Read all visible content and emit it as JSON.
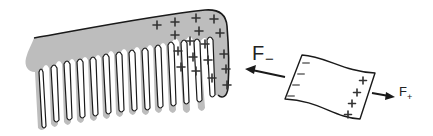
{
  "figure": {
    "colors": {
      "comb_fill": "#bdbdbd",
      "ink": "#1a1a1a",
      "negative_mark": "#8c8c8c",
      "background": "#ffffff"
    },
    "comb": {
      "charge_sign": "+",
      "teeth_count": 15
    },
    "paper": {
      "left_edge_charges": [
        "−",
        "−",
        "−",
        "−"
      ],
      "right_edge_charges": [
        "+",
        "+",
        "+",
        "+"
      ]
    },
    "forces": {
      "left": {
        "symbol": "F",
        "subscript": "−",
        "direction": "left"
      },
      "right": {
        "symbol": "F",
        "subscript": "+",
        "direction": "right"
      }
    }
  }
}
